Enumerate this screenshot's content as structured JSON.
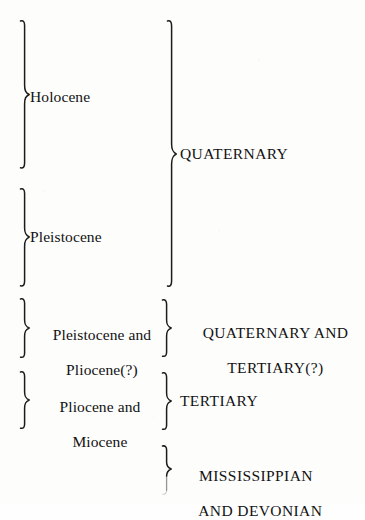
{
  "figure": {
    "kind": "geologic-correlation-brace-diagram",
    "background_color": "#fdfdfc",
    "ink_color": "#1b1b1b"
  },
  "columns": {
    "left_heading": "",
    "right_heading": ""
  },
  "rows": [
    {
      "id": "holocene",
      "epoch_label": "Holocene",
      "brace_name": "brace-holocene"
    },
    {
      "id": "pleistocene",
      "epoch_label": "Pleistocene",
      "brace_name": "brace-pleistocene"
    },
    {
      "id": "pleistocene-pliocene",
      "epoch_label": "Pleistocene and\nPliocene(?)",
      "brace_name": "brace-pleistocene-pliocene",
      "period_label": "QUATERNARY AND\nTERTIARY(?)",
      "period_brace_name": "brace-quaternary-and-tertiary"
    },
    {
      "id": "pliocene-miocene",
      "epoch_label": "Pliocene and\nMiocene",
      "brace_name": "brace-pliocene-miocene",
      "period_label": "TERTIARY",
      "period_brace_name": "brace-tertiary"
    },
    {
      "id": "mississippian-devonian",
      "epoch_label": "",
      "period_label": "MISSISSIPPIAN\nAND DEVONIAN",
      "period_brace_name": "brace-mississippian-and-devonian"
    }
  ],
  "periods": {
    "quaternary": {
      "label": "QUATERNARY",
      "brace_name": "brace-quaternary",
      "spans": [
        "Holocene",
        "Pleistocene"
      ]
    }
  },
  "labels": {
    "holocene": "Holocene",
    "pleistocene": "Pleistocene",
    "pleistocene_and_pliocene_line1": "Pleistocene and",
    "pleistocene_and_pliocene_line2": "Pliocene(?)",
    "pliocene_and_miocene_line1": "Pliocene and",
    "pliocene_and_miocene_line2": "Miocene",
    "quaternary": "QUATERNARY",
    "quaternary_and_tertiary_line1": "QUATERNARY AND",
    "quaternary_and_tertiary_line2": "TERTIARY(?)",
    "tertiary": "TERTIARY",
    "mississippian_line1": "MISSISSIPPIAN",
    "mississippian_line2": "AND DEVONIAN"
  }
}
